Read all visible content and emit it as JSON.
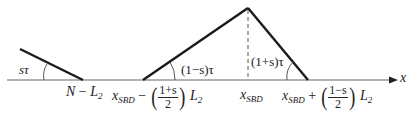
{
  "diagram": {
    "axis_label": "x",
    "angles": {
      "left": "sτ",
      "triangle_left": "(1−s)τ",
      "triangle_right": "(1+s)τ"
    },
    "ticks": {
      "n_minus_l2": {
        "a": "N",
        "op": "−",
        "b": "L",
        "b_sub": "2"
      },
      "left_base": {
        "var": "x",
        "var_sub": "SBD",
        "op": "−",
        "num": "1+s",
        "den": "2",
        "tail": "L",
        "tail_sub": "2"
      },
      "apex": {
        "var": "x",
        "var_sub": "SBD"
      },
      "right_base": {
        "var": "x",
        "var_sub": "SBD",
        "op": "+",
        "num": "1−s",
        "den": "2",
        "tail": "L",
        "tail_sub": "2"
      }
    },
    "colors": {
      "line": "#1a1a1a",
      "axis": "#555555",
      "text": "#222222"
    }
  }
}
